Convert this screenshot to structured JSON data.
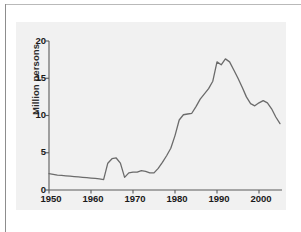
{
  "figure": {
    "panel_background": "#f1f1f1",
    "line_color": "#6b6b6b",
    "axis_color": "#5a5a5a"
  },
  "chart_data": {
    "type": "line",
    "title": "",
    "xlabel": "",
    "ylabel": "Million persons",
    "xlim": [
      1950,
      2005
    ],
    "ylim": [
      0,
      20
    ],
    "xticks": [
      1950,
      1960,
      1970,
      1980,
      1990,
      2000
    ],
    "yticks": [
      0,
      5,
      10,
      15,
      20
    ],
    "grid": false,
    "legend": null,
    "series": [
      {
        "name": "Million persons",
        "x": [
          1950,
          1951,
          1952,
          1953,
          1954,
          1955,
          1956,
          1957,
          1958,
          1959,
          1960,
          1961,
          1962,
          1963,
          1964,
          1965,
          1966,
          1967,
          1968,
          1969,
          1970,
          1971,
          1972,
          1973,
          1974,
          1975,
          1976,
          1977,
          1978,
          1979,
          1980,
          1981,
          1982,
          1983,
          1984,
          1985,
          1986,
          1987,
          1988,
          1989,
          1990,
          1991,
          1992,
          1993,
          1994,
          1995,
          1996,
          1997,
          1998,
          1999,
          2000,
          2001,
          2002,
          2003,
          2004,
          2005
        ],
        "values": [
          2.2,
          2.1,
          2.0,
          1.95,
          1.9,
          1.85,
          1.8,
          1.75,
          1.7,
          1.65,
          1.6,
          1.55,
          1.5,
          1.4,
          3.6,
          4.2,
          4.3,
          3.6,
          1.7,
          2.3,
          2.4,
          2.4,
          2.6,
          2.5,
          2.3,
          2.3,
          2.9,
          3.7,
          4.6,
          5.6,
          7.3,
          9.4,
          10.1,
          10.2,
          10.3,
          11.2,
          12.2,
          12.9,
          13.6,
          14.6,
          17.2,
          16.8,
          17.6,
          17.2,
          16.1,
          15.0,
          13.8,
          12.5,
          11.6,
          11.3,
          11.7,
          12.0,
          11.7,
          10.9,
          9.8,
          8.9
        ]
      }
    ]
  },
  "axis_labels": {
    "y": [
      "20",
      "15",
      "10",
      "5",
      "0"
    ],
    "x": [
      "1950",
      "1960",
      "1970",
      "1980",
      "1990",
      "2000"
    ],
    "y_title": "Million persons"
  }
}
